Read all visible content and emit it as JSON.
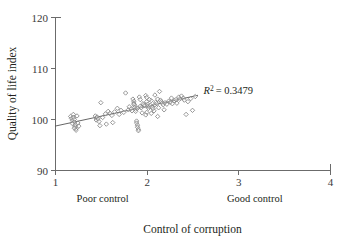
{
  "chart_data": {
    "type": "scatter",
    "title": "",
    "xlabel": "Control of corruption",
    "ylabel": "Quality of life index",
    "xlim": [
      1,
      4
    ],
    "ylim": [
      90,
      120
    ],
    "xticks": [
      "1",
      "2",
      "3",
      "4"
    ],
    "xtick_values": [
      1,
      2,
      3,
      4
    ],
    "yticks": [
      "90",
      "100",
      "110",
      "120"
    ],
    "ytick_values": [
      90,
      100,
      110,
      120
    ],
    "grid": false,
    "legend": "none",
    "marker": "open-diamond",
    "marker_color": "#7d7d7d",
    "annotations": [
      {
        "name": "r-squared",
        "text": "R2 = 0.3479",
        "r_symbol": "R",
        "r_exponent": "2",
        "r_value": "= 0.3479",
        "x": 2.62,
        "y": 104.9
      }
    ],
    "axis_range_labels": [
      {
        "name": "poor-control",
        "text": "Poor control",
        "x": 1.52
      },
      {
        "name": "good-control",
        "text": "Good control",
        "x": 3.18
      }
    ],
    "trendline": {
      "type": "linear",
      "r_squared": 0.3479,
      "x_start": 1.0,
      "y_start": 98.6,
      "x_end": 2.56,
      "y_end": 104.65
    },
    "points": [
      [
        1.17,
        100.5
      ],
      [
        1.18,
        100.1
      ],
      [
        1.19,
        99.7
      ],
      [
        1.2,
        100.9
      ],
      [
        1.2,
        100.3
      ],
      [
        1.21,
        99.9
      ],
      [
        1.21,
        99.4
      ],
      [
        1.22,
        98.9
      ],
      [
        1.22,
        98.5
      ],
      [
        1.23,
        98.1
      ],
      [
        1.23,
        97.8
      ],
      [
        1.24,
        100.6
      ],
      [
        1.25,
        99.2
      ],
      [
        1.26,
        98.6
      ],
      [
        1.19,
        99.1
      ],
      [
        1.21,
        98.2
      ],
      [
        1.44,
        100.6
      ],
      [
        1.45,
        100.2
      ],
      [
        1.45,
        99.8
      ],
      [
        1.46,
        100.4
      ],
      [
        1.47,
        100.0
      ],
      [
        1.48,
        99.5
      ],
      [
        1.49,
        98.7
      ],
      [
        1.5,
        103.2
      ],
      [
        1.52,
        100.3
      ],
      [
        1.55,
        101.0
      ],
      [
        1.58,
        101.5
      ],
      [
        1.6,
        101.1
      ],
      [
        1.62,
        100.7
      ],
      [
        1.63,
        99.3
      ],
      [
        1.65,
        101.4
      ],
      [
        1.68,
        102.1
      ],
      [
        1.72,
        101.7
      ],
      [
        1.75,
        101.3
      ],
      [
        1.77,
        105.1
      ],
      [
        1.8,
        101.8
      ],
      [
        1.83,
        102.0
      ],
      [
        1.84,
        101.6
      ],
      [
        1.85,
        103.9
      ],
      [
        1.86,
        103.5
      ],
      [
        1.86,
        103.1
      ],
      [
        1.87,
        102.7
      ],
      [
        1.87,
        102.3
      ],
      [
        1.88,
        101.9
      ],
      [
        1.88,
        101.5
      ],
      [
        1.89,
        99.6
      ],
      [
        1.89,
        99.2
      ],
      [
        1.9,
        98.8
      ],
      [
        1.9,
        98.4
      ],
      [
        1.91,
        98.0
      ],
      [
        1.91,
        97.7
      ],
      [
        1.92,
        104.3
      ],
      [
        1.93,
        102.5
      ],
      [
        1.94,
        102.2
      ],
      [
        1.95,
        101.2
      ],
      [
        1.96,
        103.0
      ],
      [
        1.97,
        102.8
      ],
      [
        1.98,
        102.6
      ],
      [
        1.99,
        104.6
      ],
      [
        2.0,
        104.2
      ],
      [
        2.0,
        103.4
      ],
      [
        2.01,
        102.9
      ],
      [
        2.01,
        102.5
      ],
      [
        2.02,
        102.1
      ],
      [
        2.03,
        102.4
      ],
      [
        2.04,
        102.7
      ],
      [
        2.05,
        103.6
      ],
      [
        2.06,
        102.3
      ],
      [
        2.07,
        102.0
      ],
      [
        2.08,
        101.6
      ],
      [
        2.09,
        102.8
      ],
      [
        2.1,
        103.3
      ],
      [
        2.11,
        103.0
      ],
      [
        2.12,
        100.5
      ],
      [
        2.13,
        102.2
      ],
      [
        2.14,
        105.4
      ],
      [
        2.15,
        103.7
      ],
      [
        2.16,
        103.4
      ],
      [
        2.17,
        103.1
      ],
      [
        2.18,
        102.8
      ],
      [
        2.19,
        101.8
      ],
      [
        2.2,
        103.2
      ],
      [
        2.22,
        102.9
      ],
      [
        2.24,
        103.5
      ],
      [
        2.26,
        103.3
      ],
      [
        2.28,
        103.0
      ],
      [
        2.3,
        103.6
      ],
      [
        2.32,
        103.8
      ],
      [
        2.35,
        104.3
      ],
      [
        2.36,
        103.9
      ],
      [
        2.38,
        104.5
      ],
      [
        2.4,
        104.1
      ],
      [
        2.41,
        103.7
      ],
      [
        2.43,
        100.9
      ],
      [
        2.45,
        103.4
      ],
      [
        2.48,
        104.0
      ],
      [
        2.5,
        101.7
      ],
      [
        2.53,
        104.4
      ],
      [
        2.0,
        101.3
      ],
      [
        1.93,
        103.8
      ],
      [
        2.05,
        101.1
      ],
      [
        1.99,
        100.8
      ],
      [
        2.09,
        104.7
      ],
      [
        1.81,
        102.4
      ],
      [
        1.7,
        100.9
      ],
      [
        1.56,
        99.0
      ],
      [
        2.27,
        104.1
      ],
      [
        2.33,
        103.1
      ],
      [
        1.86,
        102.9
      ],
      [
        1.9,
        102.1
      ],
      [
        2.03,
        103.8
      ],
      [
        2.12,
        103.9
      ]
    ]
  }
}
